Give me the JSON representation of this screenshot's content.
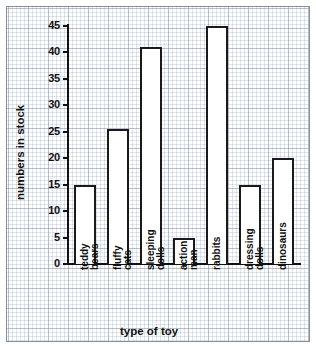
{
  "chart_data": {
    "type": "bar",
    "title": "",
    "xlabel": "type of toy",
    "ylabel": "numbers in stock",
    "categories": [
      "teddy bears",
      "fluffy cats",
      "sleeping dolls",
      "action man",
      "rabbits",
      "dressing dolls",
      "dinosaurs"
    ],
    "category_lines": [
      [
        "teddy",
        "bears"
      ],
      [
        "fluffy",
        "cats"
      ],
      [
        "sleeping",
        "dolls"
      ],
      [
        "action",
        "man"
      ],
      [
        "rabbits",
        ""
      ],
      [
        "dressing",
        "dolls"
      ],
      [
        "dinosaurs",
        ""
      ]
    ],
    "values": [
      15,
      25.5,
      41,
      5,
      45,
      15,
      20
    ],
    "ylim": [
      0,
      45
    ],
    "ytick_labels": [
      "0",
      "5",
      "10",
      "15",
      "20",
      "25",
      "30",
      "35",
      "40",
      "45"
    ],
    "ytick_values": [
      0,
      5,
      10,
      15,
      20,
      25,
      30,
      35,
      40,
      45
    ],
    "grid": true,
    "legend": "none",
    "bar_fill": "#ffffff",
    "bar_outline": "#1a1a1a",
    "grid_color": "#a5b4c6",
    "axis_color": "#111111",
    "background": "#ffffff"
  }
}
